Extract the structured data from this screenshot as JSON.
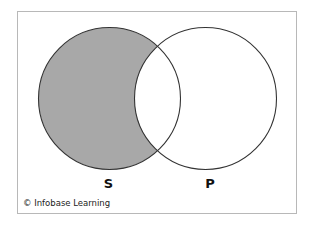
{
  "diagram": {
    "type": "venn",
    "sets": [
      {
        "id": "S",
        "label": "S",
        "cx": 109.5,
        "cy": 98.5,
        "r": 71,
        "shaded_region": "S-only"
      },
      {
        "id": "P",
        "label": "P",
        "cx": 205.5,
        "cy": 98.5,
        "r": 71,
        "shaded_region": "none"
      }
    ],
    "shaded": "S minus P",
    "colors": {
      "shade": "#a8a8a8",
      "stroke": "#333333",
      "frame": "#b8b8b8",
      "background": "#ffffff"
    }
  },
  "labels": {
    "set_s": "S",
    "set_p": "P"
  },
  "credit": {
    "text": "© Infobase Learning"
  }
}
